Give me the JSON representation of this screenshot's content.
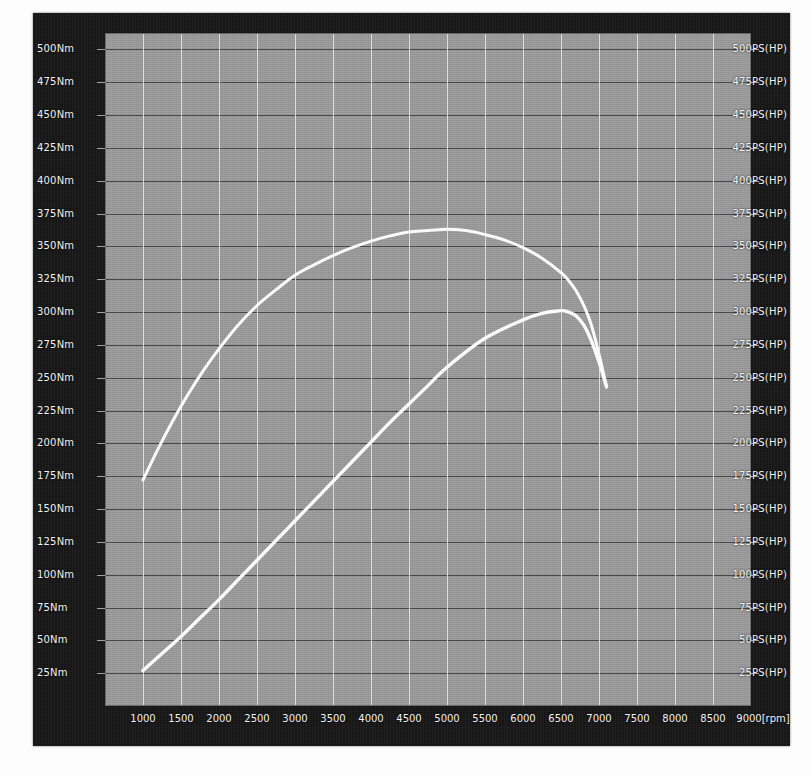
{
  "chart_data": {
    "type": "line",
    "title": "",
    "xlabel": "[rpm]",
    "ylabel": "Nm",
    "y2label": "PS(HP)",
    "grid": true,
    "legend": "none",
    "xlim": [
      500,
      9000
    ],
    "ylim": [
      0,
      512.5
    ],
    "y2lim": [
      0,
      512.5
    ],
    "x_ticks": [
      1000,
      1500,
      2000,
      2500,
      3000,
      3500,
      4000,
      4500,
      5000,
      5500,
      6000,
      6500,
      7000,
      7500,
      8000,
      8500,
      9000
    ],
    "x_tick_labels": [
      "1000",
      "1500",
      "2000",
      "2500",
      "3000",
      "3500",
      "4000",
      "4500",
      "5000",
      "5500",
      "6000",
      "6500",
      "7000",
      "7500",
      "8000",
      "8500",
      "9000[rpm]"
    ],
    "y_ticks": [
      25,
      50,
      75,
      100,
      125,
      150,
      175,
      200,
      225,
      250,
      275,
      300,
      325,
      350,
      375,
      400,
      425,
      450,
      475,
      500
    ],
    "y_tick_labels": [
      "25Nm",
      "50Nm",
      "75Nm",
      "100Nm",
      "125Nm",
      "150Nm",
      "175Nm",
      "200Nm",
      "225Nm",
      "250Nm",
      "275Nm",
      "300Nm",
      "325Nm",
      "350Nm",
      "375Nm",
      "400Nm",
      "425Nm",
      "450Nm",
      "475Nm",
      "500Nm"
    ],
    "y2_ticks": [
      25,
      50,
      75,
      100,
      125,
      150,
      175,
      200,
      225,
      250,
      275,
      300,
      325,
      350,
      375,
      400,
      425,
      450,
      475,
      500
    ],
    "y2_tick_labels": [
      "25PS(HP)",
      "50PS(HP)",
      "75PS(HP)",
      "100PS(HP)",
      "125PS(HP)",
      "150PS(HP)",
      "175PS(HP)",
      "200PS(HP)",
      "225PS(HP)",
      "250PS(HP)",
      "275PS(HP)",
      "300PS(HP)",
      "325PS(HP)",
      "350PS(HP)",
      "375PS(HP)",
      "400PS(HP)",
      "425PS(HP)",
      "450PS(HP)",
      "475PS(HP)",
      "500PS(HP)"
    ],
    "series": [
      {
        "name": "torque",
        "unit": "Nm",
        "axis": "left",
        "color": "#fafafa",
        "x": [
          1000,
          1200,
          1400,
          1600,
          1800,
          2000,
          2250,
          2500,
          2750,
          3000,
          3250,
          3500,
          3750,
          4000,
          4250,
          4500,
          4750,
          5000,
          5250,
          5500,
          5750,
          6000,
          6250,
          6500,
          6600,
          6700,
          6800,
          6900,
          7000,
          7100
        ],
        "values": [
          172,
          196,
          218,
          238,
          256,
          272,
          290,
          305,
          317,
          328,
          336,
          343,
          349,
          354,
          358,
          361,
          362,
          363,
          362,
          359,
          355,
          349,
          341,
          330,
          324,
          316,
          305,
          290,
          268,
          243
        ]
      },
      {
        "name": "power",
        "unit": "PS(HP)",
        "axis": "right",
        "color": "#fafafa",
        "x": [
          1000,
          1250,
          1500,
          1750,
          2000,
          2250,
          2500,
          2750,
          3000,
          3250,
          3500,
          3750,
          4000,
          4250,
          4500,
          4750,
          5000,
          5500,
          6000,
          6250,
          6500,
          6600,
          6700,
          6800,
          6900,
          7000,
          7100
        ],
        "values": [
          27,
          40,
          53,
          67,
          81,
          96,
          111,
          126,
          141,
          156,
          171,
          186,
          201,
          216,
          230,
          244,
          258,
          280,
          294,
          299,
          301,
          300,
          297,
          290,
          278,
          262,
          243
        ]
      }
    ],
    "annotations": {
      "peak_torque_nm": 363,
      "peak_torque_rpm": 5000,
      "peak_power_ps": 301,
      "peak_power_rpm": 6500
    }
  }
}
